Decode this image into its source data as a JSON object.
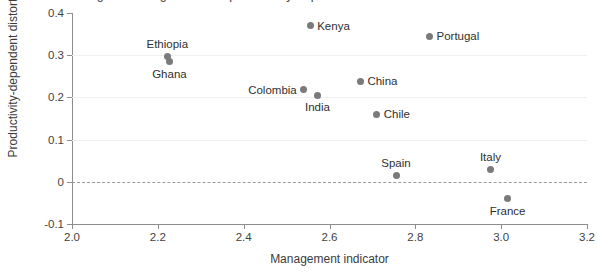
{
  "chart_data": {
    "type": "scatter",
    "title": "Figure: Management and productivity-dependent distortions across countries",
    "xlabel": "Management indicator",
    "ylabel": "Productivity-dependent distortions",
    "xlim": [
      2.0,
      3.2
    ],
    "ylim": [
      -0.1,
      0.4
    ],
    "xticks": [
      "2.0",
      "2.2",
      "2.4",
      "2.6",
      "2.8",
      "3.0",
      "3.2"
    ],
    "xtick_values": [
      2.0,
      2.2,
      2.4,
      2.6,
      2.8,
      3.0,
      3.2
    ],
    "yticks": [
      "0.4",
      "0.3",
      "0.2",
      "0.1",
      "0",
      "-0.1"
    ],
    "ytick_values": [
      0.4,
      0.3,
      0.2,
      0.1,
      0,
      -0.1
    ],
    "grid": "horizontal-light",
    "legend": "none",
    "marker_color": "#7a7a7a",
    "zero_reference_line": {
      "value": 0,
      "style": "dashed",
      "color": "#9a9a9a"
    },
    "points": [
      {
        "label": "Kenya",
        "x": 2.555,
        "y": 0.37,
        "label_pos": "right"
      },
      {
        "label": "Portugal",
        "x": 2.833,
        "y": 0.345,
        "label_pos": "right"
      },
      {
        "label": "Ethiopia",
        "x": 2.222,
        "y": 0.297,
        "label_pos": "above"
      },
      {
        "label": "Ghana",
        "x": 2.227,
        "y": 0.285,
        "label_pos": "below"
      },
      {
        "label": "China",
        "x": 2.672,
        "y": 0.238,
        "label_pos": "right"
      },
      {
        "label": "Colombia",
        "x": 2.54,
        "y": 0.218,
        "label_pos": "left"
      },
      {
        "label": "India",
        "x": 2.572,
        "y": 0.205,
        "label_pos": "below"
      },
      {
        "label": "Chile",
        "x": 2.71,
        "y": 0.16,
        "label_pos": "right"
      },
      {
        "label": "Italy",
        "x": 2.975,
        "y": 0.03,
        "label_pos": "above"
      },
      {
        "label": "Spain",
        "x": 2.755,
        "y": 0.015,
        "label_pos": "above"
      },
      {
        "label": "France",
        "x": 3.015,
        "y": -0.04,
        "label_pos": "below"
      }
    ]
  }
}
